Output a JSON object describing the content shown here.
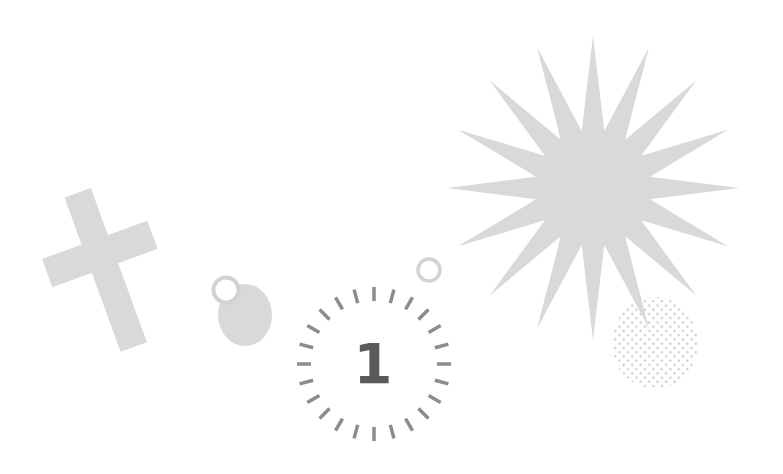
{
  "scene": {
    "description": "Decorative clip-art composition of light gray shapes on white",
    "colors": {
      "background": "#ffffff",
      "shape_fill": "#d9d9d9",
      "ring_stroke": "#cfcfcf",
      "tick_color": "#8c8c8c",
      "number_color": "#5a5a5a",
      "dot_color": "#cfcfcf"
    }
  },
  "shapes": [
    {
      "id": "cross",
      "kind": "tilted-cross"
    },
    {
      "id": "pendant",
      "kind": "ring-over-disc"
    },
    {
      "id": "small-ring",
      "kind": "ring"
    },
    {
      "id": "starburst",
      "kind": "star",
      "points": 16
    },
    {
      "id": "dotted-ellipse",
      "kind": "halftone-ellipse"
    },
    {
      "id": "countdown-dial",
      "kind": "tick-ring",
      "tick_count": 24
    }
  ],
  "countdown": {
    "number": "1"
  }
}
